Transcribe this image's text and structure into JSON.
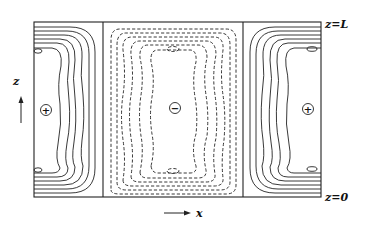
{
  "figure": {
    "type": "contour plot of convection cells",
    "labels": {
      "top_boundary": "z=L",
      "bottom_boundary": "z=0",
      "vertical_axis": "z",
      "horizontal_axis": "x"
    },
    "cells": [
      {
        "position": "left",
        "sign": "+",
        "line_style": "solid"
      },
      {
        "position": "center",
        "sign": "−",
        "line_style": "dashed"
      },
      {
        "position": "right",
        "sign": "+",
        "line_style": "solid"
      }
    ],
    "colors": {
      "line": "#222222",
      "background": "#ffffff"
    }
  }
}
